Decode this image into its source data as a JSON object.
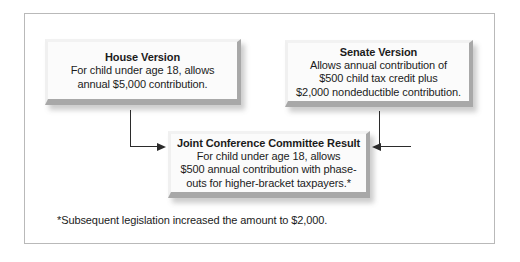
{
  "diagram": {
    "boxes": [
      {
        "id": "house",
        "title": "House Version",
        "body": "For child under age 18, allows\nannual $5,000 contribution."
      },
      {
        "id": "senate",
        "title": "Senate Version",
        "body": "Allows annual contribution of\n$500 child tax credit plus\n$2,000 nondeductible contribution."
      },
      {
        "id": "joint",
        "title": "Joint Conference Committee Result",
        "body": "For child under age 18, allows\n$500 annual contribution with phase-\nouts for higher-bracket taxpayers.*"
      }
    ],
    "footnote": "*Subsequent legislation increased the amount to $2,000.",
    "connectors": [
      {
        "name": "house-to-joint",
        "from": "house",
        "to": "joint",
        "arrow": "right"
      },
      {
        "name": "senate-to-joint",
        "from": "senate",
        "to": "joint",
        "arrow": "left"
      }
    ],
    "colors": {
      "frame_border": "#b9b9b9",
      "box_fill": "#fbfbfb",
      "box_bevel_dark": "#a8a8a8",
      "box_bevel_light": "#f2f2f2",
      "connector": "#2b2b2b",
      "text": "#1b1b1b",
      "background": "#ffffff"
    }
  }
}
